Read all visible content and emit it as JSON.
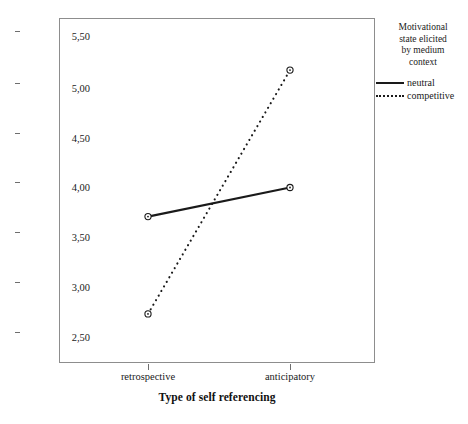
{
  "chart_data": {
    "type": "line",
    "title": "",
    "xlabel": "Type of self referencing",
    "ylabel": "Estimated Marginal Means - Attitude toward the Ad",
    "categories": [
      "retrospective",
      "anticipatory"
    ],
    "series": [
      {
        "name": "neutral",
        "style": "solid",
        "values": [
          3.71,
          4.0
        ]
      },
      {
        "name": "competitive",
        "style": "dotted",
        "values": [
          2.74,
          5.17
        ]
      }
    ],
    "ylim": [
      2.36,
      5.79
    ],
    "yticks": [
      5.5,
      5.0,
      4.5,
      4.0,
      3.5,
      3.0,
      2.5
    ],
    "ytick_labels": [
      "5,50",
      "5,00",
      "4,50",
      "4,00",
      "3,50",
      "3,00",
      "2,50"
    ],
    "grid": false,
    "legend_position": "right",
    "legend_title": "Motivational state elicited by medium context",
    "line_color": "#1a1a1a",
    "frame_color": "#8d8d8d"
  },
  "yaxis": {
    "title": "Estimated Marginal Means - Attitude toward the Ad",
    "ticks": [
      {
        "label": "5,50"
      },
      {
        "label": "5,00"
      },
      {
        "label": "4,50"
      },
      {
        "label": "4,00"
      },
      {
        "label": "3,50"
      },
      {
        "label": "3,00"
      },
      {
        "label": "2,50"
      }
    ]
  },
  "xaxis": {
    "title": "Type of self referencing",
    "ticks": [
      {
        "label": "retrospective"
      },
      {
        "label": "anticipatory"
      }
    ]
  },
  "legend": {
    "title_lines": [
      "Motivational",
      "state elicited",
      "by medium",
      "context"
    ],
    "entries": [
      {
        "label": "neutral",
        "style": "solid"
      },
      {
        "label": "competitive",
        "style": "dotted"
      }
    ]
  }
}
